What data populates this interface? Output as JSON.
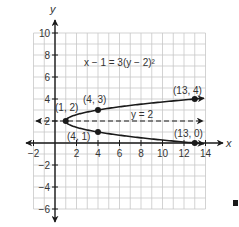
{
  "chart_data": {
    "type": "line",
    "title": "",
    "xlabel": "x",
    "ylabel": "y",
    "xlim": [
      -2,
      14
    ],
    "ylim": [
      -6,
      10
    ],
    "grid": true,
    "grid_step": 1,
    "x_ticks": [
      -2,
      2,
      4,
      6,
      8,
      10,
      12,
      14
    ],
    "y_ticks": [
      10,
      8,
      6,
      4,
      2,
      -2,
      -4,
      -6
    ],
    "x_tick_labels": [
      "−2",
      "2",
      "4",
      "6",
      "8",
      "10",
      "12",
      "14"
    ],
    "y_tick_labels": [
      "10",
      "8",
      "6",
      "4",
      "2",
      "−2",
      "−4",
      "−6"
    ],
    "equation_label": "x − 1 = 3(y − 2)²",
    "series": [
      {
        "name": "parabola",
        "equation": "x - 1 = 3(y - 2)^2",
        "style": "solid",
        "color": "#1a1a1a",
        "points": [
          {
            "x": 13.9,
            "y": 4.07
          },
          {
            "x": 13,
            "y": 4
          },
          {
            "x": 10,
            "y": 3.73
          },
          {
            "x": 7,
            "y": 3.41
          },
          {
            "x": 4,
            "y": 3
          },
          {
            "x": 2.5,
            "y": 2.71
          },
          {
            "x": 1.5,
            "y": 2.41
          },
          {
            "x": 1,
            "y": 2
          },
          {
            "x": 1.5,
            "y": 1.59
          },
          {
            "x": 2.5,
            "y": 1.29
          },
          {
            "x": 4,
            "y": 1
          },
          {
            "x": 7,
            "y": 0.59
          },
          {
            "x": 10,
            "y": 0.27
          },
          {
            "x": 13,
            "y": 0
          },
          {
            "x": 13.9,
            "y": -0.07
          }
        ]
      },
      {
        "name": "axis of symmetry",
        "equation": "y = 2",
        "style": "dashed",
        "color": "#1a1a1a",
        "points": [
          {
            "x": -2,
            "y": 2
          },
          {
            "x": 14,
            "y": 2
          }
        ]
      }
    ],
    "marked_points": [
      {
        "x": 1,
        "y": 2,
        "label": "(1, 2)"
      },
      {
        "x": 4,
        "y": 3,
        "label": "(4, 3)"
      },
      {
        "x": 4,
        "y": 1,
        "label": "(4, 1)"
      },
      {
        "x": 13,
        "y": 4,
        "label": "(13, 4)"
      },
      {
        "x": 13,
        "y": 0,
        "label": "(13, 0)"
      }
    ],
    "annotations": [
      {
        "text": "x − 1 = 3(y − 2)²"
      },
      {
        "text": "y = 2"
      }
    ]
  },
  "labels": {
    "x_axis": "x",
    "y_axis": "y",
    "equation": "x − 1 = 3(y − 2)²",
    "axis_of_symmetry": "y = 2",
    "pt_vertex": "(1, 2)",
    "pt_4_3": "(4, 3)",
    "pt_4_1": "(4, 1)",
    "pt_13_4": "(13, 4)",
    "pt_13_0": "(13, 0)"
  },
  "colors": {
    "grid": "#c8c8c8",
    "axis": "#1a1a1a",
    "curve": "#1a1a1a",
    "text": "#333333"
  }
}
